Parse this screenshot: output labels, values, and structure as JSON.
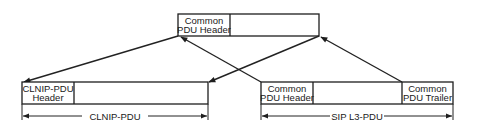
{
  "diagram": {
    "top_box": {
      "header_line1": "Common",
      "header_line2": "PDU Header"
    },
    "clnip_box": {
      "header_line1": "CLNIP-PDU",
      "header_line2": "Header",
      "dimension_label": "CLNIP-PDU"
    },
    "sip_box": {
      "header_line1": "Common",
      "header_line2": "PDU Header",
      "trailer_line1": "Common",
      "trailer_line2": "PDU Trailer",
      "dimension_label": "SIP L3-PDU"
    },
    "colors": {
      "line": "#1e1e1e",
      "background": "#ffffff"
    }
  }
}
